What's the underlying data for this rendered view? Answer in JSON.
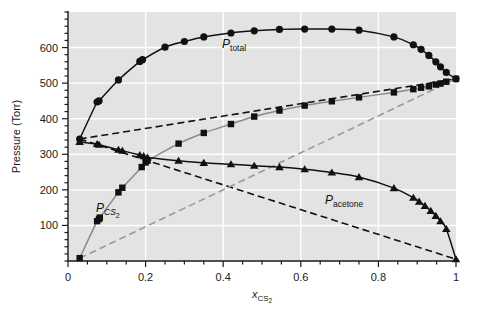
{
  "figure": {
    "background": "#ffffff",
    "plot_background": "#e3e3e3",
    "gridline_color": "#ffffff",
    "axis_color": "#1a1a1a"
  },
  "axes": {
    "y_label_main": "Pressure (Torr)",
    "x_label_main": "x",
    "x_label_sub": "CS",
    "x_label_sub2": "2",
    "y_ticks": [
      "100",
      "200",
      "300",
      "400",
      "500",
      "600"
    ],
    "x_ticks": [
      "0",
      "0.2",
      "0.4",
      "0.6",
      "0.8",
      "1"
    ]
  },
  "labels": {
    "total": {
      "p": "P",
      "sub": "total"
    },
    "cs2": {
      "p": "P",
      "sub": "CS",
      "sub2": "2"
    },
    "acetone": {
      "p": "P",
      "sub": "acetone"
    }
  },
  "chart_data": {
    "type": "scatter",
    "title": "",
    "xlabel": "x_CS2",
    "ylabel": "Pressure (Torr)",
    "xlim": [
      0,
      1
    ],
    "ylim": [
      0,
      700
    ],
    "grid": true,
    "legend": "inline-annotations",
    "series": [
      {
        "name": "P_total",
        "label": "P_total",
        "marker": "circle",
        "marker_color": "#111111",
        "line_color": "#111111",
        "line_style": "solid",
        "points": [
          [
            0.03,
            343
          ],
          [
            0.075,
            447
          ],
          [
            0.08,
            450
          ],
          [
            0.13,
            509
          ],
          [
            0.185,
            561
          ],
          [
            0.192,
            566
          ],
          [
            0.25,
            601
          ],
          [
            0.3,
            617
          ],
          [
            0.35,
            630
          ],
          [
            0.42,
            641
          ],
          [
            0.48,
            647
          ],
          [
            0.545,
            651
          ],
          [
            0.61,
            652
          ],
          [
            0.68,
            652
          ],
          [
            0.75,
            649
          ],
          [
            0.84,
            630
          ],
          [
            0.89,
            608
          ],
          [
            0.91,
            595
          ],
          [
            0.93,
            578
          ],
          [
            0.948,
            560
          ],
          [
            0.96,
            546
          ],
          [
            0.975,
            530
          ],
          [
            1.0,
            512
          ]
        ]
      },
      {
        "name": "P_CS2",
        "label": "P_CS2",
        "marker": "square",
        "marker_color": "#111111",
        "line_color": "#8a8a8a",
        "line_style": "solid",
        "points": [
          [
            0.03,
            8
          ],
          [
            0.075,
            112
          ],
          [
            0.08,
            118
          ],
          [
            0.082,
            122
          ],
          [
            0.13,
            193
          ],
          [
            0.14,
            206
          ],
          [
            0.19,
            264
          ],
          [
            0.2,
            277
          ],
          [
            0.205,
            282
          ],
          [
            0.285,
            330
          ],
          [
            0.35,
            360
          ],
          [
            0.42,
            385
          ],
          [
            0.48,
            406
          ],
          [
            0.545,
            423
          ],
          [
            0.61,
            437
          ],
          [
            0.68,
            449
          ],
          [
            0.75,
            460
          ],
          [
            0.84,
            474
          ],
          [
            0.89,
            483
          ],
          [
            0.91,
            487
          ],
          [
            0.93,
            491
          ],
          [
            0.948,
            496
          ],
          [
            0.96,
            499
          ],
          [
            0.975,
            504
          ],
          [
            1.0,
            512
          ]
        ]
      },
      {
        "name": "P_acetone",
        "label": "P_acetone",
        "marker": "triangle",
        "marker_color": "#111111",
        "line_color": "#111111",
        "line_style": "solid",
        "points": [
          [
            0.03,
            335
          ],
          [
            0.075,
            329
          ],
          [
            0.08,
            327
          ],
          [
            0.13,
            313
          ],
          [
            0.14,
            310
          ],
          [
            0.185,
            298
          ],
          [
            0.195,
            295
          ],
          [
            0.205,
            291
          ],
          [
            0.285,
            282
          ],
          [
            0.35,
            276
          ],
          [
            0.42,
            272
          ],
          [
            0.48,
            268
          ],
          [
            0.545,
            264
          ],
          [
            0.61,
            258
          ],
          [
            0.68,
            249
          ],
          [
            0.75,
            236
          ],
          [
            0.84,
            205
          ],
          [
            0.89,
            178
          ],
          [
            0.905,
            167
          ],
          [
            0.92,
            155
          ],
          [
            0.935,
            141
          ],
          [
            0.948,
            127
          ],
          [
            0.96,
            112
          ],
          [
            0.975,
            90
          ],
          [
            1.0,
            5
          ]
        ]
      }
    ],
    "reference_lines": [
      {
        "name": "raoult_total",
        "style": "dashed",
        "color": "#111111",
        "from": [
          0.03,
          343
        ],
        "to": [
          1.0,
          512
        ]
      },
      {
        "name": "raoult_acetone",
        "style": "dashed",
        "color": "#111111",
        "from": [
          0.03,
          343
        ],
        "to": [
          1.0,
          5
        ]
      },
      {
        "name": "raoult_cs2",
        "style": "dashed",
        "color": "#9a9a9a",
        "from": [
          0.03,
          8
        ],
        "to": [
          1.0,
          512
        ]
      }
    ]
  }
}
